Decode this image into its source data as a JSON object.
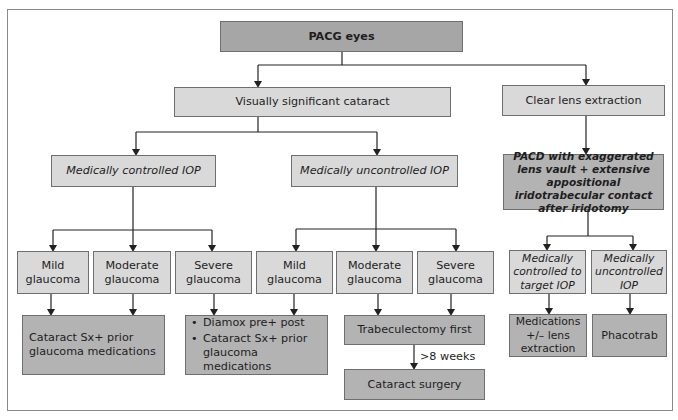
{
  "diagram": {
    "type": "flowchart",
    "root": {
      "label": "PACG eyes"
    },
    "branches": [
      {
        "label": "Visually significant cataract",
        "children": [
          {
            "label": "Medically controlled IOP",
            "children": [
              {
                "label": "Mild glaucoma"
              },
              {
                "label": "Moderate glaucoma"
              },
              {
                "label": "Severe glaucoma"
              }
            ]
          },
          {
            "label": "Medically uncontrolled IOP",
            "children": [
              {
                "label": "Mild glaucoma"
              },
              {
                "label": "Moderate glaucoma"
              },
              {
                "label": "Severe glaucoma"
              }
            ]
          }
        ]
      },
      {
        "label": "Clear lens extraction",
        "children": [
          {
            "label": "PACD with exaggerated lens vault + extensive appositional iridotrabecular contact after iridotomy",
            "children": [
              {
                "label": "Medically controlled to target IOP"
              },
              {
                "label": "Medically uncontrolled IOP"
              }
            ]
          }
        ]
      }
    ],
    "outcomes": {
      "cataract_sx_prior": "Cataract Sx+ prior glaucoma medications",
      "diamox_list": [
        "Diamox pre+ post",
        "Cataract Sx+ prior glaucoma medications"
      ],
      "trabeculectomy": "Trabeculectomy first",
      "interval": ">8 weeks",
      "cataract_surgery": "Cataract surgery",
      "medications": "Medications +/– lens extraction",
      "phacotrab": "Phacotrab"
    },
    "labels": {
      "root": "PACG eyes",
      "vsc": "Visually significant cataract",
      "cle": "Clear lens extraction",
      "mc_iop": "Medically controlled IOP",
      "mu_iop": "Medically uncontrolled IOP",
      "pacd": "PACD with exaggerated lens vault + extensive appositional iridotrabecular contact after iridotomy",
      "mild": "Mild glaucoma",
      "moderate": "Moderate glaucoma",
      "severe": "Severe glaucoma",
      "ctrl_target": "Medically controlled to target IOP",
      "uncontrolled": "Medically uncontrolled IOP"
    },
    "colors": {
      "root_fill": "#a6a6a6",
      "node_fill": "#d9d9d9",
      "outcome_fill": "#b3b3b3",
      "border": "#6f6f6f",
      "line": "#222222"
    }
  }
}
